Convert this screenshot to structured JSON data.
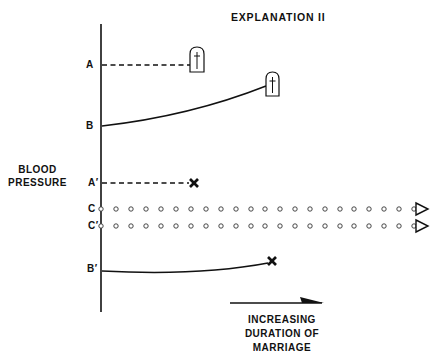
{
  "title": "EXPLANATION II",
  "y_axis_label": [
    "BLOOD",
    "PRESSURE"
  ],
  "x_axis_label": [
    "INCREASING",
    "DURATION OF",
    "MARRIAGE"
  ],
  "lines": [
    {
      "label": "A",
      "style": "dashed",
      "end_marker": "tombstone-with-cross",
      "y_start": 65,
      "x_end": 190
    },
    {
      "label": "B",
      "style": "solid-curve",
      "end_marker": "tombstone-with-cross",
      "y_start": 126,
      "x_end": 266
    },
    {
      "label": "A′",
      "style": "dashed",
      "end_marker": "x-mark",
      "y_start": 183,
      "x_end": 194
    },
    {
      "label": "C",
      "style": "dotted-circles",
      "end_marker": "open-triangle-arrow",
      "y_start": 209,
      "x_end": 428
    },
    {
      "label": "C′",
      "style": "dotted-circles",
      "end_marker": "open-triangle-arrow",
      "y_start": 226,
      "x_end": 428
    },
    {
      "label": "B′",
      "style": "solid-curve",
      "end_marker": "x-mark",
      "y_start": 270,
      "x_end": 272
    }
  ],
  "colors": {
    "ink": "#111111",
    "background": "#ffffff"
  }
}
